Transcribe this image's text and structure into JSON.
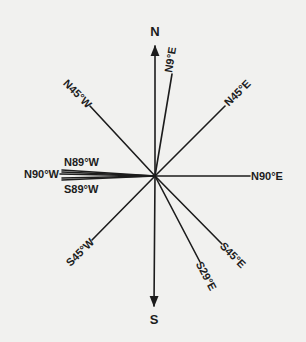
{
  "diagram": {
    "type": "compass-bearing-diagram",
    "colors": {
      "background": "#f1f1ef",
      "ink": "#1c1c1c"
    },
    "center": {
      "x": 155,
      "y": 176
    },
    "axes": {
      "north": {
        "label": "N"
      },
      "south": {
        "label": "S"
      }
    },
    "bearings": [
      {
        "id": "n9e",
        "label": "N9°E"
      },
      {
        "id": "n45e",
        "label": "N45°E"
      },
      {
        "id": "n90e",
        "label": "N90°E"
      },
      {
        "id": "s45e",
        "label": "S45°E"
      },
      {
        "id": "s29e",
        "label": "S29°E"
      },
      {
        "id": "s45w",
        "label": "S45°W"
      },
      {
        "id": "s89w",
        "label": "S89°W"
      },
      {
        "id": "n90w",
        "label": "N90°W"
      },
      {
        "id": "n89w",
        "label": "N89°W"
      },
      {
        "id": "n45w",
        "label": "N45°W"
      }
    ]
  }
}
